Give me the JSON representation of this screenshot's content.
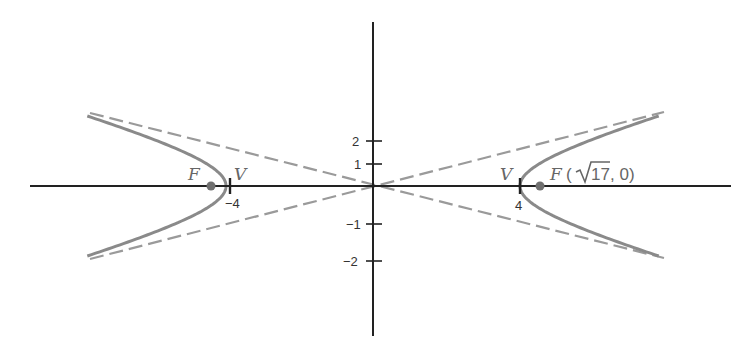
{
  "figure": {
    "title": "",
    "equation": "x^2/16 - y^2/1 = 1",
    "colors": {
      "axis": "#222222",
      "curve": "#8a8a8a",
      "asymptote": "#9a9a9a",
      "focus_point": "#707070",
      "label": "#666666"
    },
    "x_axis": {
      "ticks": [
        {
          "value": -4,
          "label": "−4"
        },
        {
          "value": 4,
          "label": "4"
        }
      ]
    },
    "y_axis": {
      "ticks": [
        {
          "value": 2,
          "label": "2"
        },
        {
          "value": 1,
          "label": "1"
        },
        {
          "value": -1,
          "label": "−1"
        },
        {
          "value": -2,
          "label": "−2"
        }
      ]
    },
    "labels": {
      "focus_left": "F",
      "vertex_left": "V",
      "vertex_right": "V",
      "focus_right_letter": "F",
      "focus_right_open": "(",
      "focus_right_radicand": "17",
      "focus_right_close": ", 0)"
    },
    "points": {
      "vertex_left": [
        -4,
        0
      ],
      "vertex_right": [
        4,
        0
      ],
      "focus_left": [
        "-√17",
        0
      ],
      "focus_right": [
        "√17",
        0
      ]
    },
    "asymptotes": [
      "y = x/4",
      "y = -x/4"
    ]
  }
}
